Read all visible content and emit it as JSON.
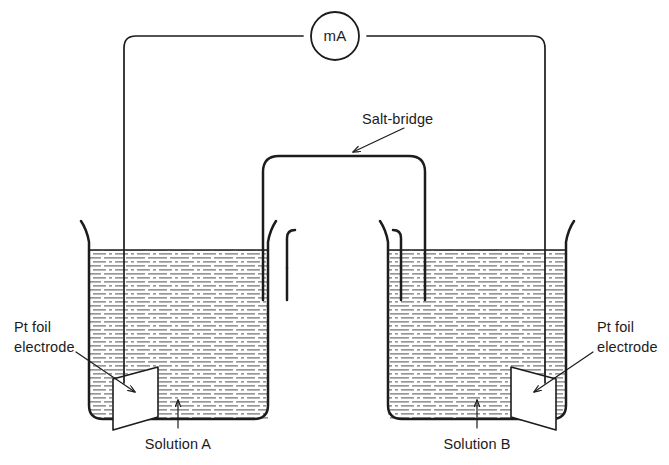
{
  "diagram": {
    "meter": {
      "label": "mA",
      "name": "milliammeter"
    },
    "labels": {
      "salt_bridge": "Salt-bridge",
      "electrode_left_line1": "Pt foil",
      "electrode_left_line2": "electrode",
      "electrode_right_line1": "Pt foil",
      "electrode_right_line2": "electrode",
      "solution_left": "Solution A",
      "solution_right": "Solution B"
    },
    "colors": {
      "ink": "#1c1c1c",
      "background": "#ffffff",
      "liquid_hatch": "#8c8c8c",
      "electrode_fill": "#ffffff"
    },
    "components": {
      "beaker_left": "beaker containing Solution A",
      "beaker_right": "beaker containing Solution B",
      "electrode_left": "Pt foil electrode in Solution A",
      "electrode_right": "Pt foil electrode in Solution B",
      "salt_bridge": "inverted U-tube salt-bridge linking both beakers",
      "circuit_wire": "external wire connecting both electrodes through the milliammeter"
    }
  }
}
